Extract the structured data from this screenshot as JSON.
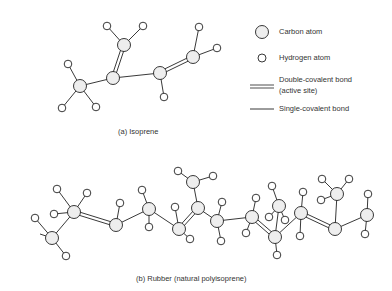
{
  "legend": {
    "carbon": "Carbon atom",
    "hydrogen": "Hydrogen atom",
    "double_bond_line1": "Double-covalent bond",
    "double_bond_line2": "(active site)",
    "single_bond": "Single-covalent bond"
  },
  "captions": {
    "a": "(a)  Isoprene",
    "b": "(b)  Rubber (natural polyisoprene)"
  },
  "colors": {
    "line": "#222222",
    "atom_fill": "#eeeeee",
    "text": "#333333"
  },
  "isoprene": {
    "carbons": [
      [
        80,
        86
      ],
      [
        113,
        78
      ],
      [
        124,
        45
      ],
      [
        160,
        73
      ],
      [
        193,
        57
      ]
    ],
    "hydrogens": [
      [
        68,
        64
      ],
      [
        62,
        108
      ],
      [
        96,
        107
      ],
      [
        107,
        26
      ],
      [
        143,
        26
      ],
      [
        164,
        97
      ],
      [
        199,
        27
      ],
      [
        217,
        48
      ]
    ],
    "single_bonds": [
      [
        0,
        1
      ],
      [
        1,
        3
      ]
    ],
    "double_bonds": [
      [
        1,
        2
      ],
      [
        3,
        4
      ]
    ],
    "ch_bonds": [
      [
        0,
        0
      ],
      [
        0,
        1
      ],
      [
        0,
        2
      ],
      [
        2,
        3
      ],
      [
        2,
        4
      ],
      [
        3,
        5
      ],
      [
        4,
        6
      ],
      [
        4,
        7
      ]
    ]
  },
  "rubber": {
    "carbons": [
      [
        52,
        238
      ],
      [
        74,
        212
      ],
      [
        116,
        225
      ],
      [
        149,
        209
      ],
      [
        179,
        229
      ],
      [
        198,
        208
      ],
      [
        193,
        182
      ],
      [
        217,
        221
      ],
      [
        252,
        217
      ],
      [
        275,
        237
      ],
      [
        279,
        206
      ],
      [
        301,
        213
      ],
      [
        335,
        229
      ],
      [
        337,
        194
      ],
      [
        367,
        215
      ]
    ],
    "hydrogens": [
      [
        35,
        218
      ],
      [
        66,
        256
      ],
      [
        57,
        189
      ],
      [
        87,
        193
      ],
      [
        54,
        214
      ],
      [
        120,
        203
      ],
      [
        142,
        190
      ],
      [
        149,
        227
      ],
      [
        175,
        207
      ],
      [
        190,
        239
      ],
      [
        178,
        171
      ],
      [
        213,
        176
      ],
      [
        222,
        202
      ],
      [
        221,
        241
      ],
      [
        256,
        198
      ],
      [
        246,
        233
      ],
      [
        272,
        186
      ],
      [
        269,
        217
      ],
      [
        285,
        220
      ],
      [
        277,
        255
      ],
      [
        303,
        192
      ],
      [
        300,
        236
      ],
      [
        322,
        179
      ],
      [
        349,
        179
      ],
      [
        321,
        200
      ],
      [
        368,
        194
      ],
      [
        365,
        234
      ]
    ],
    "single_bonds": [
      [
        0,
        1
      ],
      [
        2,
        3
      ],
      [
        3,
        4
      ],
      [
        5,
        7
      ],
      [
        5,
        6
      ],
      [
        7,
        8
      ],
      [
        9,
        10
      ],
      [
        9,
        11
      ],
      [
        12,
        13
      ],
      [
        12,
        14
      ]
    ],
    "double_bonds": [
      [
        1,
        2
      ],
      [
        4,
        5
      ],
      [
        8,
        9
      ],
      [
        11,
        12
      ]
    ],
    "ch_bonds": [
      [
        0,
        0
      ],
      [
        0,
        1
      ],
      [
        1,
        2
      ],
      [
        1,
        3
      ],
      [
        1,
        4
      ],
      [
        2,
        5
      ],
      [
        3,
        6
      ],
      [
        3,
        7
      ],
      [
        4,
        8
      ],
      [
        4,
        9
      ],
      [
        6,
        10
      ],
      [
        6,
        11
      ],
      [
        7,
        12
      ],
      [
        7,
        13
      ],
      [
        8,
        14
      ],
      [
        8,
        15
      ],
      [
        10,
        16
      ],
      [
        10,
        17
      ],
      [
        10,
        18
      ],
      [
        9,
        19
      ],
      [
        11,
        20
      ],
      [
        11,
        21
      ],
      [
        13,
        22
      ],
      [
        13,
        23
      ],
      [
        13,
        24
      ],
      [
        14,
        25
      ],
      [
        14,
        26
      ]
    ],
    "tail": [
      [
        40,
        234
      ],
      [
        52,
        238
      ]
    ]
  }
}
